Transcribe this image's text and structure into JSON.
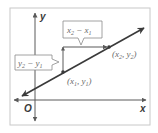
{
  "diagram": {
    "type": "slope-of-line",
    "colors": {
      "frame": "#c8c8c8",
      "axis": "#5a5a5a",
      "line": "#3a3a3a",
      "label_box": "#8a8a8a",
      "label_text": "#6a6a6a",
      "point": "#3a3a3a"
    },
    "axes": {
      "x_label": "x",
      "y_label": "y",
      "origin_label": "O"
    },
    "points": [
      {
        "name": "point-1",
        "label": "(x",
        "sub": "1",
        "mid": ", y",
        "sub2": "1",
        "end": ")"
      },
      {
        "name": "point-2",
        "label": "(x",
        "sub": "2",
        "mid": ", y",
        "sub2": "2",
        "end": ")"
      }
    ],
    "run_label": {
      "a": "x",
      "a_sub": "2",
      "op": " − ",
      "b": "x",
      "b_sub": "1"
    },
    "rise_label": {
      "a": "y",
      "a_sub": "2",
      "op": " − ",
      "b": "y",
      "b_sub": "1"
    }
  }
}
